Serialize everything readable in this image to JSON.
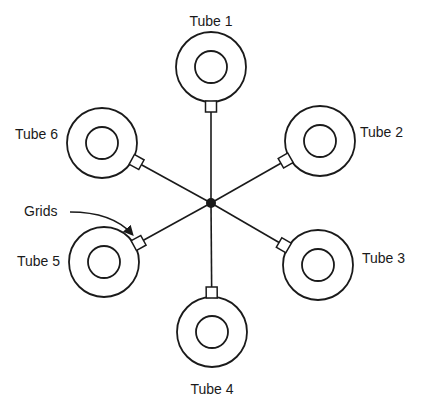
{
  "diagram": {
    "center": {
      "x": 211,
      "y": 203
    },
    "tubes": [
      {
        "id": 1,
        "label": "Tube 1",
        "cx": 211,
        "cy": 67,
        "label_x": 211,
        "label_y": 26,
        "anchor": "middle"
      },
      {
        "id": 2,
        "label": "Tube 2",
        "cx": 320,
        "cy": 141,
        "label_x": 360,
        "label_y": 137,
        "anchor": "start"
      },
      {
        "id": 3,
        "label": "Tube 3",
        "cx": 318,
        "cy": 265,
        "label_x": 362,
        "label_y": 263,
        "anchor": "start"
      },
      {
        "id": 4,
        "label": "Tube 4",
        "cx": 212,
        "cy": 332,
        "label_x": 212,
        "label_y": 394,
        "anchor": "middle"
      },
      {
        "id": 5,
        "label": "Tube 5",
        "cx": 104,
        "cy": 262,
        "label_x": 60,
        "label_y": 266,
        "anchor": "end"
      },
      {
        "id": 6,
        "label": "Tube 6",
        "cx": 102,
        "cy": 143,
        "label_x": 58,
        "label_y": 139,
        "anchor": "end"
      }
    ],
    "annotation": {
      "label": "Grids",
      "x": 24,
      "y": 216
    },
    "colors": {
      "stroke": "#1a1a1a",
      "background": "#ffffff"
    }
  }
}
